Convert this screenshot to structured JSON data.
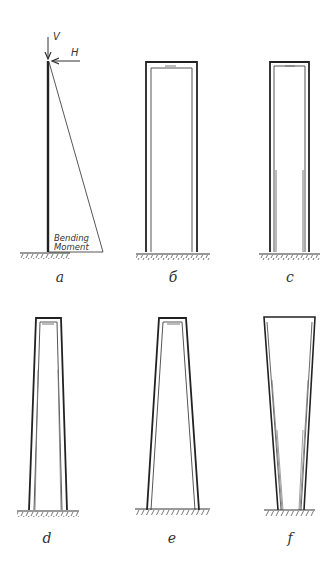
{
  "diagram": {
    "ink_color": "#2a2a2a",
    "light_ink_color": "#888888",
    "panels": [
      {
        "id": "a",
        "label": "a",
        "description": "slender column with bending moment diagram"
      },
      {
        "id": "b",
        "label": "б",
        "description": "rectangular portal frame, uniform legs"
      },
      {
        "id": "c",
        "label": "c",
        "description": "narrow portal frame with thickened lower legs"
      },
      {
        "id": "d",
        "label": "d",
        "description": "slightly tapered frame, wider at base"
      },
      {
        "id": "e",
        "label": "e",
        "description": "tapered frame, strongly wider at base"
      },
      {
        "id": "f",
        "label": "f",
        "description": "inverted taper, wider at top, legs converging at base"
      }
    ],
    "annotations": {
      "vertical_load": "V",
      "horizontal_load": "H",
      "moment_line1": "Bending",
      "moment_line2": "Moment"
    }
  }
}
